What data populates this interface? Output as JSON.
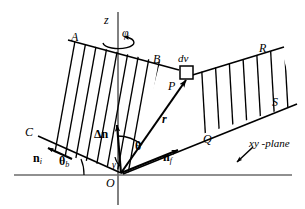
{
  "figure": {
    "background_color": "#ffffff",
    "ink_color": "#000000",
    "axis_color": "#6b6b6b"
  },
  "axes": {
    "z_label": "z",
    "phi_label": "φ",
    "xy_plane_label": "xy -plane",
    "origin_label": "O"
  },
  "slab_left": {
    "corner_top_left": "A",
    "corner_top_right": "B",
    "corner_bottom_left": "C",
    "hatch_count": 10
  },
  "slab_right": {
    "corner_top_right": "R",
    "corner_bottom_right": "S",
    "corner_bottom_left": "Q",
    "hatch_count": 7
  },
  "points": {
    "P": "P",
    "dv": "dv"
  },
  "vectors": {
    "r": "r",
    "delta_n": "Δn",
    "n_i": "n",
    "n_i_sub": "i",
    "n_f": "n",
    "n_f_sub": "f"
  },
  "angles": {
    "theta": "θ",
    "theta_b": "θ",
    "theta_b_sub": "b",
    "gamma": "γ"
  }
}
